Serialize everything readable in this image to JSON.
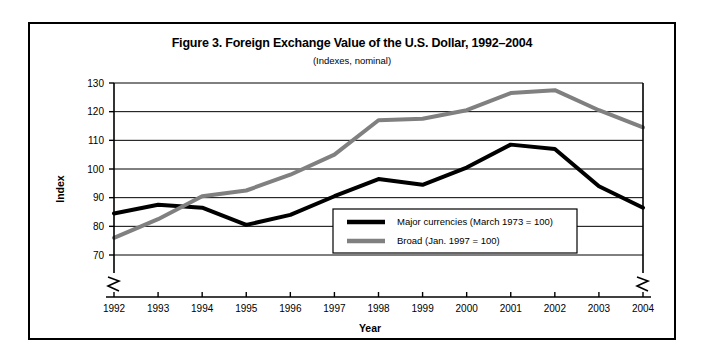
{
  "figure": {
    "title": "Figure 3. Foreign Exchange Value of the U.S. Dollar, 1992–2004",
    "subtitle": "(Indexes, nominal)"
  },
  "chart_data": {
    "type": "line",
    "title": "Figure 3. Foreign Exchange Value of the U.S. Dollar, 1992–2004",
    "subtitle": "(Indexes, nominal)",
    "xlabel": "Year",
    "ylabel": "Index",
    "categories": [
      "1992",
      "1993",
      "1994",
      "1995",
      "1996",
      "1997",
      "1998",
      "1999",
      "2000",
      "2001",
      "2002",
      "2003",
      "2004"
    ],
    "x": [
      1992,
      1993,
      1994,
      1995,
      1996,
      1997,
      1998,
      1999,
      2000,
      2001,
      2002,
      2003,
      2004
    ],
    "xlim": [
      1992,
      2004
    ],
    "ylim": [
      70,
      130
    ],
    "yticks": [
      70,
      80,
      90,
      100,
      110,
      120,
      130
    ],
    "ytick_labels": [
      "70",
      "80",
      "90",
      "100",
      "110",
      "120",
      "130"
    ],
    "xticks": [
      1992,
      1993,
      1994,
      1995,
      1996,
      1997,
      1998,
      1999,
      2000,
      2001,
      2002,
      2003,
      2004
    ],
    "grid": "horizontal",
    "axis_break_y": true,
    "axis_break_x_both_ends": true,
    "legend_position": "bottom-right-inside",
    "series": [
      {
        "name": "Major currencies (March 1973 = 100)",
        "color": "#000000",
        "width": 4,
        "values": [
          84.5,
          87.5,
          86.5,
          80.5,
          84.0,
          90.5,
          96.5,
          94.5,
          100.5,
          108.5,
          107.0,
          94.0,
          86.5
        ]
      },
      {
        "name": "Broad (Jan. 1997 = 100)",
        "color": "#808080",
        "width": 4,
        "values": [
          76.0,
          82.5,
          90.5,
          92.5,
          98.0,
          105.0,
          117.0,
          117.5,
          120.5,
          126.5,
          127.5,
          120.5,
          114.5
        ]
      }
    ]
  },
  "legend": {
    "items": [
      {
        "label": "Major currencies (March 1973 = 100)",
        "color": "#000000"
      },
      {
        "label": "Broad (Jan. 1997 = 100)",
        "color": "#808080"
      }
    ]
  }
}
